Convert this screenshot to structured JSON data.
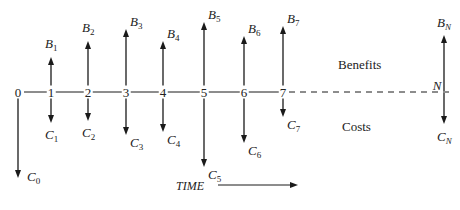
{
  "diagram": {
    "axis_y": 92,
    "periods": [
      {
        "label": "0",
        "x": 18,
        "benefit": null,
        "cost": {
          "sym": "C",
          "sub": "0",
          "y_end": 178
        }
      },
      {
        "label": "1",
        "x": 51,
        "benefit": {
          "sym": "B",
          "sub": "1",
          "y_end": 57
        },
        "cost": {
          "sym": "C",
          "sub": "1",
          "y_end": 123
        }
      },
      {
        "label": "2",
        "x": 88,
        "benefit": {
          "sym": "B",
          "sub": "2",
          "y_end": 41
        },
        "cost": {
          "sym": "C",
          "sub": "2",
          "y_end": 121
        }
      },
      {
        "label": "3",
        "x": 126,
        "benefit": {
          "sym": "B",
          "sub": "3",
          "y_end": 29
        },
        "cost": {
          "sym": "C",
          "sub": "3",
          "y_end": 135
        }
      },
      {
        "label": "4",
        "x": 163,
        "benefit": {
          "sym": "B",
          "sub": "4",
          "y_end": 41
        },
        "cost": {
          "sym": "C",
          "sub": "4",
          "y_end": 132
        }
      },
      {
        "label": "5",
        "x": 204,
        "benefit": {
          "sym": "B",
          "sub": "5",
          "y_end": 22
        },
        "cost": {
          "sym": "C",
          "sub": "5",
          "y_end": 167
        }
      },
      {
        "label": "6",
        "x": 244,
        "benefit": {
          "sym": "B",
          "sub": "6",
          "y_end": 36
        },
        "cost": {
          "sym": "C",
          "sub": "6",
          "y_end": 143
        }
      },
      {
        "label": "7",
        "x": 283,
        "benefit": {
          "sym": "B",
          "sub": "7",
          "y_end": 26
        },
        "cost": {
          "sym": "C",
          "sub": "7",
          "y_end": 117
        }
      },
      {
        "label": "N",
        "x": 444,
        "benefit": {
          "sym": "B",
          "sub": "N",
          "y_end": 35
        },
        "cost": {
          "sym": "C",
          "sub": "N",
          "y_end": 124
        }
      }
    ],
    "region_labels": {
      "benefits": "Benefits",
      "costs": "Costs"
    },
    "time_label": "TIME",
    "colors": {
      "line": "#1a1a1a",
      "text": "#222222"
    }
  }
}
